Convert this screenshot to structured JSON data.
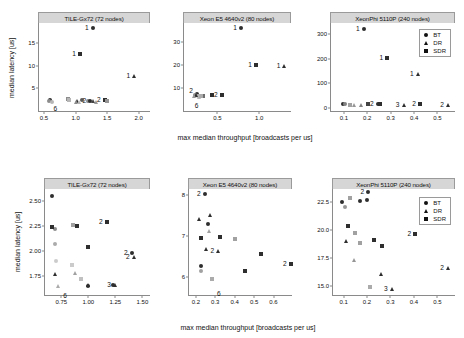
{
  "figure": {
    "xlabel": "max median throughput [broadcasts per us]",
    "ylabel": "median latency [us]",
    "legend": {
      "items": [
        {
          "label": "BT",
          "marker": "circle"
        },
        {
          "label": "DR",
          "marker": "triangle"
        },
        {
          "label": "SDR",
          "marker": "square"
        }
      ]
    }
  },
  "chart_data": [
    {
      "type": "scatter",
      "panel": "top-left",
      "title": "TILE-Gx72 (72 nodes)",
      "xlabel": "max median throughput [broadcasts per us]",
      "ylabel": "median latency [us]",
      "xlim": [
        0.42,
        2.18
      ],
      "ylim": [
        0.0,
        19.5
      ],
      "xticks": [
        "0.5",
        "1.0",
        "1.5",
        "2.0"
      ],
      "xtickvals": [
        0.5,
        1.0,
        1.5,
        2.0
      ],
      "yticks": [
        "5",
        "10",
        "15"
      ],
      "ytickvals": [
        5,
        10,
        15
      ],
      "series": [
        {
          "name": "BT",
          "marker": "circle",
          "points": [
            {
              "x": 1.27,
              "y": 18.3,
              "label": "1",
              "alpha": 1.0
            },
            {
              "x": 0.6,
              "y": 2.45,
              "alpha": 1.0
            },
            {
              "x": 0.58,
              "y": 2.3,
              "alpha": 0.55
            },
            {
              "x": 0.62,
              "y": 2.1,
              "alpha": 0.35
            },
            {
              "x": 1.1,
              "y": 2.35,
              "alpha": 0.8
            },
            {
              "x": 1.2,
              "y": 2.25,
              "alpha": 0.55
            },
            {
              "x": 1.23,
              "y": 2.2,
              "label": "2",
              "alpha": 1.0
            }
          ]
        },
        {
          "name": "DR",
          "marker": "triangle",
          "points": [
            {
              "x": 1.93,
              "y": 7.8,
              "label": "1",
              "alpha": 1.0
            },
            {
              "x": 1.03,
              "y": 2.25,
              "alpha": 1.0
            },
            {
              "x": 1.0,
              "y": 2.05,
              "alpha": 0.55
            },
            {
              "x": 1.05,
              "y": 1.9,
              "alpha": 0.35
            },
            {
              "x": 1.28,
              "y": 2.2,
              "alpha": 0.9
            },
            {
              "x": 1.33,
              "y": 2.1,
              "alpha": 0.5
            }
          ]
        },
        {
          "name": "SDR",
          "marker": "square",
          "points": [
            {
              "x": 1.07,
              "y": 12.6,
              "label": "1",
              "alpha": 1.0
            },
            {
              "x": 0.88,
              "y": 2.6,
              "alpha": 0.55
            },
            {
              "x": 0.9,
              "y": 2.4,
              "alpha": 0.35
            },
            {
              "x": 1.46,
              "y": 2.35,
              "label": "2",
              "alpha": 1.0
            },
            {
              "x": 1.5,
              "y": 2.25,
              "alpha": 0.5
            }
          ]
        },
        {
          "name": "annotations",
          "marker": "none",
          "points": [
            {
              "x": 0.68,
              "y": 1.55,
              "label": "6",
              "below": true
            }
          ]
        }
      ]
    },
    {
      "type": "scatter",
      "panel": "top-middle",
      "title": "Xeon E5 4640v2 (80 nodes)",
      "xlim": [
        0.1,
        1.38
      ],
      "ylim": [
        0.0,
        38.0
      ],
      "xticks": [
        "0.5",
        "1.0"
      ],
      "xtickvals": [
        0.5,
        1.0
      ],
      "yticks": [
        "10",
        "20",
        "30"
      ],
      "ytickvals": [
        10,
        20,
        30
      ],
      "series": [
        {
          "name": "BT",
          "marker": "circle",
          "points": [
            {
              "x": 0.78,
              "y": 36.0,
              "label": "1",
              "alpha": 1.0
            },
            {
              "x": 0.25,
              "y": 7.4,
              "alpha": 1.0
            },
            {
              "x": 0.23,
              "y": 6.9,
              "alpha": 0.55
            },
            {
              "x": 0.27,
              "y": 6.4,
              "alpha": 0.35
            }
          ]
        },
        {
          "name": "DR",
          "marker": "triangle",
          "points": [
            {
              "x": 1.3,
              "y": 19.6,
              "label": "1",
              "alpha": 1.0
            },
            {
              "x": 0.24,
              "y": 7.1,
              "alpha": 1.0
            },
            {
              "x": 0.22,
              "y": 6.5,
              "alpha": 0.5
            },
            {
              "x": 0.28,
              "y": 6.2,
              "alpha": 0.35
            }
          ]
        },
        {
          "name": "SDR",
          "marker": "square",
          "points": [
            {
              "x": 0.96,
              "y": 19.9,
              "label": "1",
              "alpha": 1.0
            },
            {
              "x": 0.33,
              "y": 6.6,
              "alpha": 0.7
            },
            {
              "x": 0.3,
              "y": 6.3,
              "alpha": 0.4
            },
            {
              "x": 0.44,
              "y": 6.8,
              "alpha": 1.0
            },
            {
              "x": 0.55,
              "y": 6.7,
              "label": "2",
              "alpha": 1.0
            }
          ]
        },
        {
          "name": "annotations",
          "marker": "none",
          "points": [
            {
              "x": 0.25,
              "y": 4.4,
              "label": "6",
              "below": true
            },
            {
              "x": 0.255,
              "y": 8.6,
              "label": "2",
              "alpha": 1.0,
              "textonly": true
            }
          ]
        }
      ]
    },
    {
      "type": "scatter",
      "panel": "top-right",
      "title": "XeonPhi 5110P (240 nodes)",
      "xlim": [
        0.045,
        0.575
      ],
      "ylim": [
        -12.0,
        345.0
      ],
      "xticks": [
        "0.1",
        "0.2",
        "0.3",
        "0.4",
        "0.5"
      ],
      "xtickvals": [
        0.1,
        0.2,
        0.3,
        0.4,
        0.5
      ],
      "yticks": [
        "0",
        "100",
        "200",
        "300"
      ],
      "ytickvals": [
        0,
        100,
        200,
        300
      ],
      "series": [
        {
          "name": "BT",
          "marker": "circle",
          "points": [
            {
              "x": 0.185,
              "y": 320.0,
              "label": "1",
              "alpha": 1.0
            },
            {
              "x": 0.095,
              "y": 18.0,
              "alpha": 1.0
            },
            {
              "x": 0.105,
              "y": 15.0,
              "alpha": 0.6
            },
            {
              "x": 0.245,
              "y": 16.0,
              "label": "2",
              "alpha": 1.0
            }
          ]
        },
        {
          "name": "DR",
          "marker": "triangle",
          "points": [
            {
              "x": 0.415,
              "y": 140.0,
              "label": "1",
              "alpha": 1.0
            },
            {
              "x": 0.145,
              "y": 13.0,
              "alpha": 0.5
            },
            {
              "x": 0.175,
              "y": 14.0,
              "alpha": 0.6
            },
            {
              "x": 0.355,
              "y": 14.0,
              "label": "3",
              "alpha": 1.0
            },
            {
              "x": 0.545,
              "y": 14.0,
              "label": "2",
              "alpha": 1.0
            }
          ]
        },
        {
          "name": "SDR",
          "marker": "square",
          "points": [
            {
              "x": 0.285,
              "y": 205.0,
              "label": "1",
              "alpha": 1.0
            },
            {
              "x": 0.125,
              "y": 14.0,
              "alpha": 0.45
            },
            {
              "x": 0.205,
              "y": 15.0,
              "alpha": 0.9
            },
            {
              "x": 0.255,
              "y": 16.0,
              "alpha": 1.0
            },
            {
              "x": 0.425,
              "y": 16.0,
              "label": "2",
              "alpha": 1.0
            }
          ]
        }
      ]
    },
    {
      "type": "scatter",
      "panel": "bottom-left",
      "title": "TILE-Gx72 (72 nodes)",
      "xlim": [
        0.6,
        1.57
      ],
      "ylim": [
        1.56,
        2.62
      ],
      "xticks": [
        "0.75",
        "1.00",
        "1.25",
        "1.50"
      ],
      "xtickvals": [
        0.75,
        1.0,
        1.25,
        1.5
      ],
      "yticks": [
        "1.75",
        "2.00",
        "2.25",
        "2.50"
      ],
      "ytickvals": [
        1.75,
        2.0,
        2.25,
        2.5
      ],
      "series": [
        {
          "name": "BT",
          "marker": "circle",
          "points": [
            {
              "x": 0.665,
              "y": 2.555,
              "alpha": 1.0
            },
            {
              "x": 0.695,
              "y": 2.225,
              "alpha": 0.55
            },
            {
              "x": 0.688,
              "y": 2.075,
              "alpha": 0.4
            },
            {
              "x": 0.7,
              "y": 1.9,
              "alpha": 0.25
            },
            {
              "x": 1.0,
              "y": 1.655,
              "alpha": 1.0
            },
            {
              "x": 1.23,
              "y": 1.665,
              "alpha": 1.0
            },
            {
              "x": 1.4,
              "y": 1.985,
              "label": "2",
              "alpha": 1.0
            }
          ]
        },
        {
          "name": "DR",
          "marker": "triangle",
          "points": [
            {
              "x": 0.695,
              "y": 1.775,
              "alpha": 1.0
            },
            {
              "x": 0.72,
              "y": 1.655,
              "alpha": 0.4
            },
            {
              "x": 0.875,
              "y": 1.78,
              "alpha": 0.45
            },
            {
              "x": 1.0,
              "y": 1.665,
              "alpha": 1.0
            },
            {
              "x": 1.245,
              "y": 1.665,
              "label": "3",
              "alpha": 1.0
            },
            {
              "x": 1.42,
              "y": 1.945,
              "label": "2",
              "alpha": 1.0
            }
          ]
        },
        {
          "name": "SDR",
          "marker": "square",
          "points": [
            {
              "x": 0.665,
              "y": 2.245,
              "alpha": 1.0
            },
            {
              "x": 0.855,
              "y": 2.265,
              "alpha": 0.45
            },
            {
              "x": 0.895,
              "y": 2.255,
              "alpha": 1.0
            },
            {
              "x": 1.0,
              "y": 2.045,
              "alpha": 1.0
            },
            {
              "x": 1.17,
              "y": 2.295,
              "label": "2",
              "alpha": 1.0
            },
            {
              "x": 0.845,
              "y": 1.86,
              "alpha": 0.25
            },
            {
              "x": 0.935,
              "y": 1.72,
              "alpha": 0.3
            }
          ]
        },
        {
          "name": "annotations",
          "marker": "none",
          "points": [
            {
              "x": 0.785,
              "y": 1.6,
              "label": "6",
              "below": true
            }
          ]
        }
      ]
    },
    {
      "type": "scatter",
      "panel": "bottom-middle",
      "title": "Xeon E5 4640v2 (80 nodes)",
      "xlim": [
        0.165,
        0.695
      ],
      "ylim": [
        5.55,
        8.15
      ],
      "xticks": [
        "0.2",
        "0.3",
        "0.4",
        "0.5",
        "0.6"
      ],
      "xtickvals": [
        0.2,
        0.3,
        0.4,
        0.5,
        0.6
      ],
      "yticks": [
        "6",
        "7",
        "8"
      ],
      "ytickvals": [
        6,
        7,
        8
      ],
      "series": [
        {
          "name": "BT",
          "marker": "circle",
          "points": [
            {
              "x": 0.245,
              "y": 8.02,
              "label": "2",
              "alpha": 1.0
            },
            {
              "x": 0.262,
              "y": 7.28,
              "alpha": 1.0
            },
            {
              "x": 0.225,
              "y": 6.25,
              "alpha": 1.0
            },
            {
              "x": 0.228,
              "y": 6.15,
              "alpha": 0.45
            }
          ]
        },
        {
          "name": "DR",
          "marker": "triangle",
          "points": [
            {
              "x": 0.275,
              "y": 7.52,
              "alpha": 1.0
            },
            {
              "x": 0.215,
              "y": 7.42,
              "alpha": 1.0
            },
            {
              "x": 0.268,
              "y": 7.12,
              "alpha": 0.45
            },
            {
              "x": 0.255,
              "y": 6.68,
              "alpha": 1.0
            },
            {
              "x": 0.315,
              "y": 6.62,
              "label": "2",
              "alpha": 1.0
            }
          ]
        },
        {
          "name": "SDR",
          "marker": "square",
          "points": [
            {
              "x": 0.228,
              "y": 6.94,
              "alpha": 1.0
            },
            {
              "x": 0.322,
              "y": 6.97,
              "alpha": 1.0
            },
            {
              "x": 0.402,
              "y": 6.92,
              "alpha": 0.45
            },
            {
              "x": 0.538,
              "y": 6.55,
              "alpha": 1.0
            },
            {
              "x": 0.452,
              "y": 6.15,
              "alpha": 1.0
            },
            {
              "x": 0.285,
              "y": 5.95,
              "alpha": 0.4
            },
            {
              "x": 0.688,
              "y": 6.32,
              "label": "2",
              "alpha": 1.0
            }
          ]
        },
        {
          "name": "annotations",
          "marker": "none",
          "points": [
            {
              "x": 0.318,
              "y": 5.7,
              "label": "6",
              "below": true
            }
          ]
        }
      ]
    },
    {
      "type": "scatter",
      "panel": "bottom-right",
      "title": "XeonPhi 5110P (240 nodes)",
      "xlim": [
        0.055,
        0.575
      ],
      "ylim": [
        14.2,
        23.7
      ],
      "xticks": [
        "0.1",
        "0.2",
        "0.3",
        "0.4",
        "0.5"
      ],
      "xtickvals": [
        0.1,
        0.2,
        0.3,
        0.4,
        0.5
      ],
      "yticks": [
        "15.0",
        "17.5",
        "20.0",
        "22.5"
      ],
      "ytickvals": [
        15.0,
        17.5,
        20.0,
        22.5
      ],
      "series": [
        {
          "name": "BT",
          "marker": "circle",
          "points": [
            {
              "x": 0.205,
              "y": 23.45,
              "label": "2",
              "alpha": 1.0
            },
            {
              "x": 0.095,
              "y": 22.5,
              "alpha": 1.0
            },
            {
              "x": 0.105,
              "y": 22.1,
              "alpha": 0.5
            },
            {
              "x": 0.168,
              "y": 22.6,
              "alpha": 1.0
            },
            {
              "x": 0.198,
              "y": 22.7,
              "alpha": 1.0
            }
          ]
        },
        {
          "name": "DR",
          "marker": "triangle",
          "points": [
            {
              "x": 0.112,
              "y": 19.0,
              "alpha": 1.0
            },
            {
              "x": 0.145,
              "y": 17.35,
              "alpha": 0.5
            },
            {
              "x": 0.258,
              "y": 16.1,
              "alpha": 1.0
            },
            {
              "x": 0.305,
              "y": 14.75,
              "label": "3",
              "alpha": 1.0
            },
            {
              "x": 0.545,
              "y": 16.6,
              "label": "2",
              "alpha": 1.0
            }
          ]
        },
        {
          "name": "SDR",
          "marker": "square",
          "points": [
            {
              "x": 0.118,
              "y": 20.4,
              "alpha": 1.0
            },
            {
              "x": 0.128,
              "y": 22.85,
              "alpha": 0.45
            },
            {
              "x": 0.148,
              "y": 19.8,
              "alpha": 0.45
            },
            {
              "x": 0.168,
              "y": 18.9,
              "alpha": 0.45
            },
            {
              "x": 0.228,
              "y": 19.1,
              "alpha": 1.0
            },
            {
              "x": 0.262,
              "y": 18.55,
              "alpha": 1.0
            },
            {
              "x": 0.212,
              "y": 14.95,
              "alpha": 0.4
            },
            {
              "x": 0.405,
              "y": 19.7,
              "label": "2",
              "alpha": 1.0
            }
          ]
        }
      ]
    }
  ]
}
